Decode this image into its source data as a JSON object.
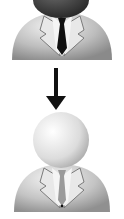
{
  "illustration": {
    "description": "User avatar transition diagram",
    "top_figure": {
      "label": "user-dark-head",
      "head_color": "#3a3a3a",
      "body_color": "#bdbdbd",
      "tie_color": "#111111"
    },
    "arrow": {
      "direction": "down",
      "color": "#111111"
    },
    "bottom_figure": {
      "label": "user-light-head",
      "head_color": "#e6e6e6",
      "body_color": "#c4c4c4",
      "tie_color": "#9a9a9a"
    }
  }
}
